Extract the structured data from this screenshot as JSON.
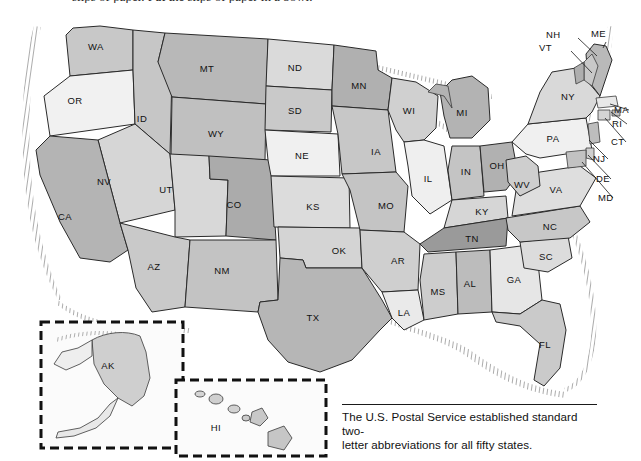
{
  "page": {
    "top_running_text": "slips of paper. Put the slips of paper in a bowl.",
    "figure_title": "United States state abbreviations map"
  },
  "caption": {
    "line1": "The U.S. Postal Service established standard two-",
    "line2": "letter abbreviations for all fifty states.",
    "full": "The U.S. Postal Service established standard two-letter abbreviations for all fifty states."
  },
  "insets": {
    "alaska": {
      "label": "AK",
      "name": "alaska-inset"
    },
    "hawaii": {
      "label": "HI",
      "name": "hawaii-inset"
    }
  },
  "colors": {
    "very_light": "#f1f1f1",
    "light": "#e2e2e2",
    "light_mid": "#d2d2d2",
    "mid": "#c2c2c2",
    "mid_dark": "#b2b2b2",
    "dark": "#a0a0a0",
    "darkest": "#949494",
    "border": "#2a2a2a",
    "label_text": "#111111",
    "background": "#ffffff"
  },
  "map": {
    "name": "united-states-map",
    "states": [
      {
        "abbr": "WA",
        "x": 96,
        "y": 47,
        "fill": "#c8c8c8"
      },
      {
        "abbr": "OR",
        "x": 75,
        "y": 101,
        "fill": "#f1f1f1"
      },
      {
        "abbr": "ID",
        "x": 142,
        "y": 119,
        "fill": "#c6c6c6"
      },
      {
        "abbr": "MT",
        "x": 207,
        "y": 69,
        "fill": "#b8b8b8"
      },
      {
        "abbr": "WY",
        "x": 216,
        "y": 134,
        "fill": "#c0c0c0"
      },
      {
        "abbr": "NV",
        "x": 104,
        "y": 182,
        "fill": "#d6d6d6"
      },
      {
        "abbr": "CA",
        "x": 65,
        "y": 217,
        "fill": "#b4b4b4"
      },
      {
        "abbr": "UT",
        "x": 166,
        "y": 190,
        "fill": "#d8d8d8"
      },
      {
        "abbr": "CO",
        "x": 234,
        "y": 205,
        "fill": "#ababab"
      },
      {
        "abbr": "AZ",
        "x": 154,
        "y": 267,
        "fill": "#c9c9c9"
      },
      {
        "abbr": "NM",
        "x": 222,
        "y": 271,
        "fill": "#c3c3c3"
      },
      {
        "abbr": "ND",
        "x": 295,
        "y": 68,
        "fill": "#dadada"
      },
      {
        "abbr": "SD",
        "x": 295,
        "y": 111,
        "fill": "#c9c9c9"
      },
      {
        "abbr": "NE",
        "x": 302,
        "y": 156,
        "fill": "#f0f0f0"
      },
      {
        "abbr": "KS",
        "x": 313,
        "y": 207,
        "fill": "#dcdcdc"
      },
      {
        "abbr": "OK",
        "x": 339,
        "y": 251,
        "fill": "#d4d4d4"
      },
      {
        "abbr": "TX",
        "x": 313,
        "y": 318,
        "fill": "#b6b6b6"
      },
      {
        "abbr": "MN",
        "x": 359,
        "y": 86,
        "fill": "#b0b0b0"
      },
      {
        "abbr": "IA",
        "x": 376,
        "y": 152,
        "fill": "#c7c7c7"
      },
      {
        "abbr": "MO",
        "x": 386,
        "y": 206,
        "fill": "#c4c4c4"
      },
      {
        "abbr": "AR",
        "x": 398,
        "y": 261,
        "fill": "#cfcfcf"
      },
      {
        "abbr": "LA",
        "x": 404,
        "y": 313,
        "fill": "#eaeaea"
      },
      {
        "abbr": "WI",
        "x": 409,
        "y": 111,
        "fill": "#d0d0d0"
      },
      {
        "abbr": "IL",
        "x": 428,
        "y": 179,
        "fill": "#efefef"
      },
      {
        "abbr": "MI",
        "x": 462,
        "y": 113,
        "fill": "#b3b3b3"
      },
      {
        "abbr": "IN",
        "x": 466,
        "y": 172,
        "fill": "#c4c4c4"
      },
      {
        "abbr": "OH",
        "x": 497,
        "y": 166,
        "fill": "#b1b1b1"
      },
      {
        "abbr": "KY",
        "x": 482,
        "y": 212,
        "fill": "#d6d6d6"
      },
      {
        "abbr": "TN",
        "x": 472,
        "y": 239,
        "fill": "#9a9a9a"
      },
      {
        "abbr": "MS",
        "x": 438,
        "y": 292,
        "fill": "#cdcdcd"
      },
      {
        "abbr": "AL",
        "x": 470,
        "y": 284,
        "fill": "#bcbcbc"
      },
      {
        "abbr": "GA",
        "x": 514,
        "y": 280,
        "fill": "#e6e6e6"
      },
      {
        "abbr": "FL",
        "x": 545,
        "y": 345,
        "fill": "#cacaca"
      },
      {
        "abbr": "SC",
        "x": 546,
        "y": 257,
        "fill": "#dcdcdc"
      },
      {
        "abbr": "NC",
        "x": 550,
        "y": 227,
        "fill": "#c7c7c7"
      },
      {
        "abbr": "VA",
        "x": 556,
        "y": 190,
        "fill": "#dedede"
      },
      {
        "abbr": "WV",
        "x": 522,
        "y": 185,
        "fill": "#cecece"
      },
      {
        "abbr": "PA",
        "x": 553,
        "y": 139,
        "fill": "#f0f0f0"
      },
      {
        "abbr": "NY",
        "x": 568,
        "y": 97,
        "fill": "#d9d9d9"
      }
    ],
    "callouts": [
      {
        "abbr": "NH",
        "x": 562,
        "y": 35,
        "lx1": 578,
        "ly1": 38,
        "lx2": 597,
        "ly2": 56
      },
      {
        "abbr": "VT",
        "x": 555,
        "y": 48,
        "lx1": 571,
        "ly1": 51,
        "lx2": 592,
        "ly2": 73
      },
      {
        "abbr": "ME",
        "x": 607,
        "y": 34,
        "lx1": 606,
        "ly1": 42,
        "lx2": 603,
        "ly2": 48
      },
      {
        "abbr": "MA",
        "x": 630,
        "y": 110,
        "lx1": 629,
        "ly1": 110,
        "lx2": 610,
        "ly2": 104
      },
      {
        "abbr": "RI",
        "x": 628,
        "y": 124,
        "lx1": 627,
        "ly1": 124,
        "lx2": 611,
        "ly2": 112
      },
      {
        "abbr": "CT",
        "x": 627,
        "y": 142,
        "lx1": 626,
        "ly1": 142,
        "lx2": 605,
        "ly2": 118
      },
      {
        "abbr": "NJ",
        "x": 609,
        "y": 159,
        "lx1": 608,
        "ly1": 159,
        "lx2": 589,
        "ly2": 140
      },
      {
        "abbr": "DE",
        "x": 612,
        "y": 179,
        "lx1": 611,
        "ly1": 179,
        "lx2": 588,
        "ly2": 155
      },
      {
        "abbr": "MD",
        "x": 614,
        "y": 198,
        "lx1": 613,
        "ly1": 198,
        "lx2": 582,
        "ly2": 162
      }
    ]
  }
}
